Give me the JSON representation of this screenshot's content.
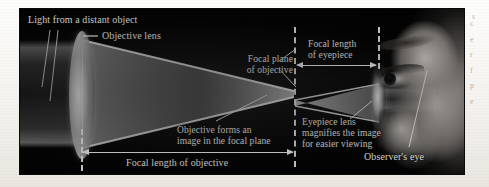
{
  "figure": {
    "title_implicit": "Refracting telescope optics",
    "background_color": "#000000",
    "page_color": "#fbfaf8",
    "label_color": "#f2f0ec"
  },
  "labels": {
    "light_source": "Light from a distant object",
    "objective_lens": "Objective lens",
    "focal_plane_objective": "Focal plane\nof objective",
    "focal_length_eyepiece": "Focal length\nof eyepiece",
    "objective_forms_image": "Objective forms an\nimage in the focal plane",
    "eyepiece_magnifies": "Eyepiece lens\nmagnifies the image\nfor easier viewing",
    "focal_length_objective": "Focal length of objective",
    "observer_eye": "Observer's eye"
  },
  "margin": {
    "fragment_top": "s",
    "fragments": [
      "c",
      "e",
      "r",
      "f",
      "p",
      "e"
    ]
  },
  "optics": {
    "elements": [
      {
        "name": "objective-lens",
        "type": "biconvex",
        "x": 62,
        "height": 128
      },
      {
        "name": "eyepiece-lens",
        "type": "biconvex",
        "x": 359,
        "height": 62
      },
      {
        "name": "focal-plane",
        "type": "dashed-line",
        "x": 275
      },
      {
        "name": "observer-eye",
        "type": "photo",
        "x": 420
      }
    ],
    "measurements": [
      {
        "name": "focal-length-objective",
        "from_x": 62,
        "to_x": 275
      },
      {
        "name": "focal-length-eyepiece",
        "from_x": 275,
        "to_x": 359
      }
    ]
  }
}
